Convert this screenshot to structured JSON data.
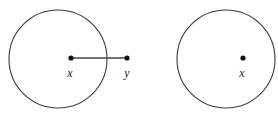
{
  "figure": {
    "type": "geometric-diagram",
    "canvas": {
      "width": 278,
      "height": 116,
      "background": "#ffffff"
    },
    "colors": {
      "circle_stroke": "#3a3a3a",
      "segment_stroke": "#454545",
      "dot_fill": "#111111",
      "label_color": "#1a1a1a"
    },
    "shapes": {
      "circles": [
        {
          "name": "left-circle",
          "cx": 58,
          "cy": 59,
          "r": 49
        },
        {
          "name": "right-circle",
          "cx": 226,
          "cy": 59,
          "r": 49
        }
      ],
      "segments": [
        {
          "name": "segment-xy",
          "x1": 71,
          "y1": 58,
          "x2": 127,
          "y2": 58
        }
      ],
      "points": [
        {
          "name": "point-x-left",
          "label": "x",
          "cx": 71,
          "cy": 58,
          "r": 2.6,
          "label_x": 70,
          "label_y": 77
        },
        {
          "name": "point-y",
          "label": "y",
          "cx": 127,
          "cy": 58,
          "r": 2.6,
          "label_x": 127,
          "label_y": 77
        },
        {
          "name": "point-x-right",
          "label": "x",
          "cx": 243,
          "cy": 58,
          "r": 2.6,
          "label_x": 242,
          "label_y": 77
        }
      ]
    }
  }
}
